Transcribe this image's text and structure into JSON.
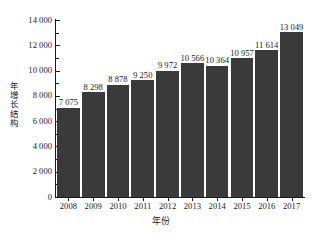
{
  "chart_data": {
    "type": "bar",
    "title": "",
    "xlabel": "年份",
    "ylabel": "年增长结构",
    "categories": [
      "2008",
      "2009",
      "2010",
      "2011",
      "2012",
      "2013",
      "2014",
      "2015",
      "2016",
      "2017"
    ],
    "values": [
      7075,
      8298,
      8878,
      9250,
      9972,
      10566,
      10364,
      10957,
      11614,
      13049
    ],
    "value_labels": [
      "7 075",
      "8 298",
      "8 878",
      "9 250",
      "9 972",
      "10 566",
      "10 364",
      "10 957",
      "11 614",
      "13 049"
    ],
    "ylim": [
      0,
      14000
    ],
    "ytick_values": [
      0,
      2000,
      4000,
      6000,
      8000,
      10000,
      12000,
      14000
    ],
    "ytick_labels": [
      "0",
      "2 000",
      "4 000",
      "6 000",
      "8 000",
      "10 000",
      "12 000",
      "14 000"
    ],
    "yminor_values": [
      1000,
      3000,
      5000,
      7000,
      9000,
      11000,
      13000
    ],
    "grid": false,
    "legend": null,
    "bar_color": "#3a3a3a",
    "axis_color": "#1a1a1a",
    "spines": [
      "left",
      "bottom"
    ]
  },
  "caption": {
    "text": ""
  }
}
